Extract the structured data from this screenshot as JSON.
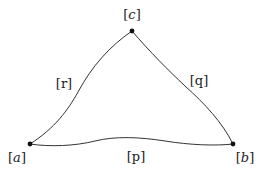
{
  "diagram": {
    "vertices": [
      {
        "id": "a",
        "label_open": "[",
        "label_var": "a",
        "label_close": "]",
        "x": 30,
        "y": 144
      },
      {
        "id": "b",
        "label_open": "[",
        "label_var": "b",
        "label_close": "]",
        "x": 233,
        "y": 144
      },
      {
        "id": "c",
        "label_open": "[",
        "label_var": "c",
        "label_close": "]",
        "x": 132,
        "y": 31
      }
    ],
    "edges": [
      {
        "id": "p",
        "from": "a",
        "to": "b",
        "label": "[p]"
      },
      {
        "id": "q",
        "from": "c",
        "to": "b",
        "label": "[q]"
      },
      {
        "id": "r",
        "from": "a",
        "to": "c",
        "label": "[r]"
      }
    ],
    "colors": {
      "stroke": "#333333",
      "node": "#111111",
      "text": "#222222"
    }
  }
}
